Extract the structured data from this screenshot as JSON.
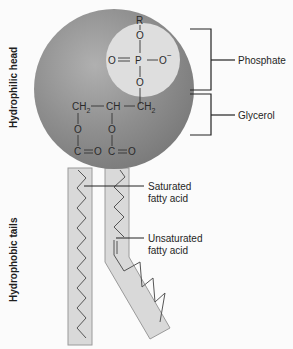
{
  "side_labels": {
    "head": "Hydrophilic head",
    "tails": "Hydrophobic tails"
  },
  "callouts": {
    "phosphate": "Phosphate",
    "glycerol": "Glycerol",
    "saturated": [
      "Saturated",
      "fatty acid"
    ],
    "unsaturated": [
      "Unsaturated",
      "fatty acid"
    ]
  },
  "chemistry": {
    "phosphate_group": {
      "top": "R",
      "upper_o": "O",
      "left_o": "O",
      "center": "P",
      "right_o": "O",
      "charge": "−",
      "lower_o": "O"
    },
    "glycerol": {
      "c1": "CH",
      "c1_sub": "2",
      "c2": "CH",
      "c3": "CH",
      "c3_sub": "2"
    },
    "ester_links": {
      "o1": "O",
      "o2": "O",
      "c_left": "C",
      "o_left": "O",
      "c_right": "C",
      "o_right": "O"
    }
  },
  "colors": {
    "head_fill": "#8a8a8a",
    "phosphate_fill": "#dcdcdc",
    "tail_fill": "#d9d9d9",
    "line": "#333333"
  }
}
